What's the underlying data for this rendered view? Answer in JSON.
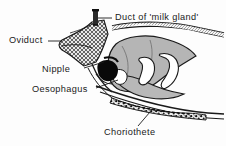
{
  "figure": {
    "background_color": "#fdfdfd",
    "ink_color": "#1a1a1a",
    "tissue_gray": "#b5b5b5",
    "cavity_white": "#ffffff"
  },
  "labels": {
    "duct": "Duct of 'milk gland'",
    "oviduct": "Oviduct",
    "nipple": "Nipple",
    "oesophagus": "Oesophagus",
    "choriothete": "Choriothete"
  },
  "structures": [
    {
      "name": "milk-gland-duct",
      "fill": "solid-dark"
    },
    {
      "name": "oviduct-wall",
      "fill": "crosshatch"
    },
    {
      "name": "nipple-blob",
      "fill": "solid-black"
    },
    {
      "name": "larva-body",
      "fill": "gray"
    },
    {
      "name": "oesophagus-lumen",
      "fill": "white"
    },
    {
      "name": "choriothete-band",
      "fill": "stipple"
    },
    {
      "name": "body-wall",
      "fill": "outline"
    }
  ]
}
